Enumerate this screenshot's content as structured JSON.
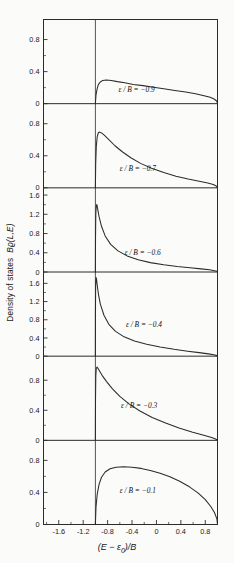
{
  "figure": {
    "ylabel_text": "Density of states  Bϱ(L,E)",
    "xlabel_text": "(E − ε",
    "xlabel_sub": "0",
    "xlabel_tail": ")/B"
  },
  "axes": {
    "xticks": [
      "-1.6",
      "-1.2",
      "-0.8",
      "-0.4",
      "0",
      "0.4",
      "0.8"
    ],
    "xtick_values": [
      -1.6,
      -1.2,
      -0.8,
      -0.4,
      0,
      0.4,
      0.8
    ],
    "xlim": [
      -1.85,
      1.0
    ],
    "xminor_step": 0.2
  },
  "panels": [
    {
      "label": "ε / B = −0.9",
      "eps_over_B": -0.9,
      "yticks": [
        "0",
        "0.4",
        "0.8"
      ],
      "ytick_values": [
        0,
        0.4,
        0.8
      ],
      "ylim": [
        0,
        1.05
      ],
      "label_x": -0.62,
      "label_y": 0.135
    },
    {
      "label": "ε / B = −0.7",
      "eps_over_B": -0.7,
      "yticks": [
        "0",
        "0.4",
        "0.8"
      ],
      "ytick_values": [
        0,
        0.4,
        0.8
      ],
      "ylim": [
        0,
        1.05
      ],
      "label_x": -0.6,
      "label_y": 0.2
    },
    {
      "label": "ε / B = −0.6",
      "eps_over_B": -0.6,
      "yticks": [
        "0",
        "0.4",
        "0.8",
        "1.2",
        "1.6"
      ],
      "ytick_values": [
        0,
        0.4,
        0.8,
        1.2,
        1.6
      ],
      "ylim": [
        0,
        1.75
      ],
      "label_x": -0.52,
      "label_y": 0.2
    },
    {
      "label": "ε / B = −0.4",
      "eps_over_B": -0.4,
      "yticks": [
        "0",
        "0.4",
        "0.8",
        "1.2",
        "1.6"
      ],
      "ytick_values": [
        0,
        0.4,
        0.8,
        1.2,
        1.6
      ],
      "ylim": [
        0,
        1.85
      ],
      "label_x": -0.5,
      "label_y": 0.35
    },
    {
      "label": "ε / B = −0.3",
      "eps_over_B": -0.3,
      "yticks": [
        "0",
        "0.4",
        "0.8"
      ],
      "ytick_values": [
        0,
        0.4,
        0.8
      ],
      "ylim": [
        0,
        1.12
      ],
      "label_x": -0.58,
      "label_y": 0.38
    },
    {
      "label": "ε / B = −0.1",
      "eps_over_B": -0.1,
      "yticks": [
        "0",
        "0.4",
        "0.8"
      ],
      "ytick_values": [
        0,
        0.4,
        0.8
      ],
      "ylim": [
        0,
        1.05
      ],
      "label_x": -0.6,
      "label_y": 0.38
    }
  ],
  "chart_data": {
    "type": "line",
    "title": "",
    "xlabel": "(E - ε₀)/B",
    "ylabel": "Density of states Bϱ(L,E)",
    "xlim": [
      -1.85,
      1.0
    ],
    "grid": false,
    "legend": "inline-annotation",
    "panel_count": 6,
    "xticks": [
      -1.6,
      -1.2,
      -0.8,
      -0.4,
      0,
      0.4,
      0.8
    ],
    "series": [
      {
        "name": "ε/B = -0.9",
        "ylim": [
          0,
          1.05
        ],
        "yticks": [
          0,
          0.4,
          0.8
        ],
        "x": [
          -1.0,
          -0.99,
          -0.97,
          -0.95,
          -0.92,
          -0.88,
          -0.82,
          -0.74,
          -0.64,
          -0.52,
          -0.38,
          -0.22,
          -0.05,
          0.12,
          0.3,
          0.48,
          0.64,
          0.78,
          0.88,
          0.95,
          0.99,
          1.0
        ],
        "y": [
          0.0,
          0.11,
          0.19,
          0.24,
          0.27,
          0.29,
          0.295,
          0.29,
          0.275,
          0.26,
          0.24,
          0.225,
          0.205,
          0.185,
          0.165,
          0.145,
          0.125,
          0.1,
          0.08,
          0.055,
          0.03,
          0.0
        ],
        "peak": {
          "x": -0.8,
          "y": 0.295
        }
      },
      {
        "name": "ε/B = -0.7",
        "ylim": [
          0,
          1.05
        ],
        "yticks": [
          0,
          0.4,
          0.8
        ],
        "x": [
          -1.0,
          -0.995,
          -0.985,
          -0.97,
          -0.95,
          -0.93,
          -0.9,
          -0.85,
          -0.78,
          -0.68,
          -0.56,
          -0.42,
          -0.26,
          -0.08,
          0.12,
          0.32,
          0.52,
          0.7,
          0.84,
          0.93,
          0.98,
          1.0
        ],
        "y": [
          0.0,
          0.3,
          0.52,
          0.64,
          0.69,
          0.695,
          0.685,
          0.655,
          0.6,
          0.525,
          0.45,
          0.375,
          0.305,
          0.245,
          0.19,
          0.145,
          0.11,
          0.082,
          0.06,
          0.042,
          0.022,
          0.0
        ],
        "peak": {
          "x": -0.93,
          "y": 0.695
        }
      },
      {
        "name": "ε/B = -0.6",
        "ylim": [
          0,
          1.75
        ],
        "yticks": [
          0,
          0.4,
          0.8,
          1.2,
          1.6
        ],
        "x": [
          -1.0,
          -0.998,
          -0.993,
          -0.985,
          -0.975,
          -0.96,
          -0.94,
          -0.9,
          -0.84,
          -0.75,
          -0.63,
          -0.48,
          -0.3,
          -0.1,
          0.12,
          0.34,
          0.55,
          0.73,
          0.87,
          0.95,
          0.99,
          1.0
        ],
        "y": [
          0.0,
          0.7,
          1.2,
          1.4,
          1.4,
          1.29,
          1.15,
          0.95,
          0.75,
          0.575,
          0.44,
          0.335,
          0.255,
          0.195,
          0.15,
          0.115,
          0.088,
          0.065,
          0.045,
          0.028,
          0.013,
          0.0
        ],
        "peak": {
          "x": -0.985,
          "y": 1.4
        }
      },
      {
        "name": "ε/B = -0.4",
        "ylim": [
          0,
          1.85
        ],
        "yticks": [
          0,
          0.4,
          0.8,
          1.2,
          1.6
        ],
        "x": [
          -1.0,
          -0.999,
          -0.996,
          -0.99,
          -0.982,
          -0.97,
          -0.95,
          -0.92,
          -0.86,
          -0.78,
          -0.67,
          -0.53,
          -0.36,
          -0.16,
          0.06,
          0.29,
          0.51,
          0.7,
          0.85,
          0.94,
          0.99,
          1.0
        ],
        "y": [
          0.0,
          0.95,
          1.55,
          1.73,
          1.7,
          1.56,
          1.36,
          1.15,
          0.9,
          0.7,
          0.545,
          0.425,
          0.335,
          0.26,
          0.2,
          0.15,
          0.11,
          0.078,
          0.05,
          0.03,
          0.012,
          0.0
        ],
        "peak": {
          "x": -0.99,
          "y": 1.73
        }
      },
      {
        "name": "ε/B = -0.3",
        "ylim": [
          0,
          1.12
        ],
        "yticks": [
          0,
          0.4,
          0.8
        ],
        "x": [
          -1.0,
          -0.998,
          -0.993,
          -0.985,
          -0.973,
          -0.955,
          -0.93,
          -0.89,
          -0.82,
          -0.72,
          -0.6,
          -0.45,
          -0.27,
          -0.07,
          0.15,
          0.37,
          0.58,
          0.76,
          0.89,
          0.96,
          0.99,
          1.0
        ],
        "y": [
          0.0,
          0.55,
          0.86,
          0.96,
          0.975,
          0.955,
          0.92,
          0.865,
          0.785,
          0.685,
          0.585,
          0.485,
          0.39,
          0.305,
          0.23,
          0.165,
          0.112,
          0.07,
          0.04,
          0.02,
          0.008,
          0.0
        ],
        "peak": {
          "x": -0.972,
          "y": 0.975
        }
      },
      {
        "name": "ε/B = -0.1",
        "ylim": [
          0,
          1.05
        ],
        "yticks": [
          0,
          0.4,
          0.8
        ],
        "x": [
          -1.0,
          -0.99,
          -0.97,
          -0.94,
          -0.9,
          -0.84,
          -0.76,
          -0.66,
          -0.54,
          -0.4,
          -0.25,
          -0.1,
          0.06,
          0.22,
          0.38,
          0.54,
          0.68,
          0.8,
          0.89,
          0.95,
          0.99,
          1.0
        ],
        "y": [
          0.0,
          0.22,
          0.38,
          0.5,
          0.59,
          0.655,
          0.695,
          0.715,
          0.72,
          0.715,
          0.7,
          0.675,
          0.64,
          0.595,
          0.54,
          0.47,
          0.395,
          0.31,
          0.225,
          0.15,
          0.07,
          0.0
        ],
        "peak": {
          "x": -0.52,
          "y": 0.72
        }
      }
    ]
  }
}
